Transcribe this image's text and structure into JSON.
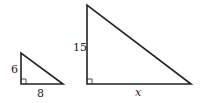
{
  "diagram": {
    "type": "similar right triangles",
    "small_triangle": {
      "leg_vertical": "6",
      "leg_horizontal": "8"
    },
    "large_triangle": {
      "leg_vertical": "15",
      "leg_horizontal": "x"
    },
    "line_color": "#222222"
  }
}
